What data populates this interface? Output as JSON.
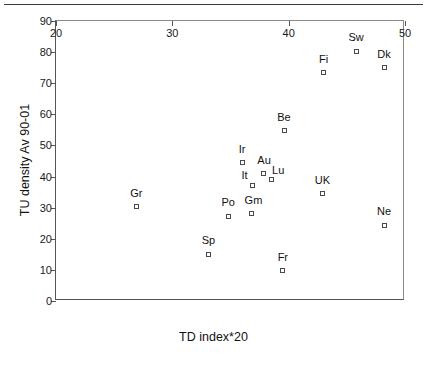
{
  "figure": {
    "top_rule": "horizontal-rule"
  },
  "chart_data": {
    "type": "scatter",
    "title": "",
    "xlabel": "TD index*20",
    "ylabel": "TU density Av 90-01",
    "xlim": [
      20,
      50
    ],
    "ylim": [
      0,
      90
    ],
    "xticks": [
      20,
      30,
      40,
      50
    ],
    "yticks": [
      0,
      10,
      20,
      30,
      40,
      50,
      60,
      70,
      80,
      90
    ],
    "xtick_labels": [
      "20",
      "30",
      "40",
      "50"
    ],
    "ytick_labels": [
      "0",
      "10",
      "20",
      "30",
      "40",
      "50",
      "60",
      "70",
      "80",
      "90"
    ],
    "grid": false,
    "legend": false,
    "marker_style": "open-square",
    "points": [
      {
        "label": "Gr",
        "x": 26.9,
        "y": 30.3,
        "label_dx": 0,
        "label_dy": -8
      },
      {
        "label": "Sp",
        "x": 33.1,
        "y": 15.1,
        "label_dx": 0,
        "label_dy": -8
      },
      {
        "label": "Po",
        "x": 34.8,
        "y": 27.2,
        "label_dx": 0,
        "label_dy": -8
      },
      {
        "label": "Gm",
        "x": 36.8,
        "y": 28.0,
        "label_dx": 2,
        "label_dy": -8
      },
      {
        "label": "Ir",
        "x": 36.0,
        "y": 44.4,
        "label_dx": 0,
        "label_dy": -8
      },
      {
        "label": "It",
        "x": 36.9,
        "y": 37.2,
        "label_dx": -8,
        "label_dy": -4
      },
      {
        "label": "Au",
        "x": 37.8,
        "y": 41.0,
        "label_dx": 1,
        "label_dy": -7
      },
      {
        "label": "Lu",
        "x": 38.5,
        "y": 38.9,
        "label_dx": 7,
        "label_dy": -4
      },
      {
        "label": "Be",
        "x": 39.6,
        "y": 54.8,
        "label_dx": 0,
        "label_dy": -8
      },
      {
        "label": "Fr",
        "x": 39.5,
        "y": 9.8,
        "label_dx": 0,
        "label_dy": -8
      },
      {
        "label": "UK",
        "x": 42.9,
        "y": 34.4,
        "label_dx": 0,
        "label_dy": -8
      },
      {
        "label": "Fi",
        "x": 43.0,
        "y": 73.4,
        "label_dx": 0,
        "label_dy": -8
      },
      {
        "label": "Sw",
        "x": 45.8,
        "y": 80.2,
        "label_dx": 0,
        "label_dy": -8
      },
      {
        "label": "Dk",
        "x": 48.2,
        "y": 75.0,
        "label_dx": 0,
        "label_dy": -8
      },
      {
        "label": "Ne",
        "x": 48.2,
        "y": 24.4,
        "label_dx": 0,
        "label_dy": -8
      }
    ]
  }
}
